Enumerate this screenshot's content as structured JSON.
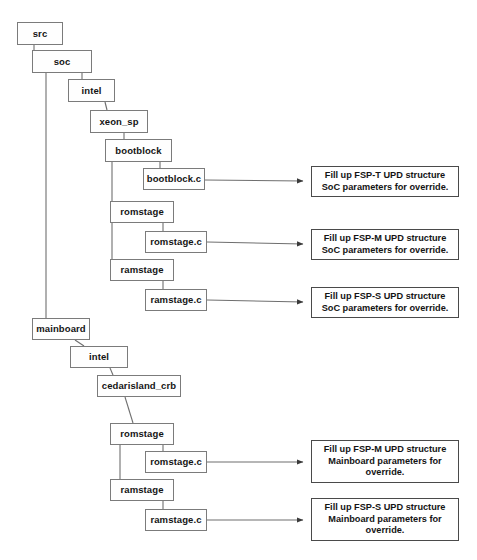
{
  "diagram": {
    "background": "#ffffff",
    "box_fill": "#fefefe",
    "box_border": "#7b7b7b",
    "note_border": "#4a4a4a",
    "line_color": "#6f6f6f",
    "text_color": "#141414",
    "nodes": [
      {
        "id": "src",
        "label": "src",
        "x": 17,
        "y": 22,
        "w": 46,
        "h": 23
      },
      {
        "id": "soc",
        "label": "soc",
        "x": 32,
        "y": 50,
        "w": 60,
        "h": 23
      },
      {
        "id": "intel_soc",
        "label": "intel",
        "x": 68,
        "y": 79,
        "w": 47,
        "h": 23
      },
      {
        "id": "xeon_sp",
        "label": "xeon_sp",
        "x": 90,
        "y": 110,
        "w": 58,
        "h": 23
      },
      {
        "id": "bootblock",
        "label": "bootblock",
        "x": 105,
        "y": 139,
        "w": 67,
        "h": 23
      },
      {
        "id": "bootblock_c",
        "label": "bootblock.c",
        "x": 143,
        "y": 168,
        "w": 62,
        "h": 22
      },
      {
        "id": "romstage_soc",
        "label": "romstage",
        "x": 110,
        "y": 201,
        "w": 64,
        "h": 22
      },
      {
        "id": "romstage_c_soc",
        "label": "romstage.c",
        "x": 145,
        "y": 231,
        "w": 62,
        "h": 22
      },
      {
        "id": "ramstage_soc",
        "label": "ramstage",
        "x": 110,
        "y": 259,
        "w": 64,
        "h": 22
      },
      {
        "id": "ramstage_c_soc",
        "label": "ramstage.c",
        "x": 145,
        "y": 289,
        "w": 62,
        "h": 22
      },
      {
        "id": "mainboard",
        "label": "mainboard",
        "x": 32,
        "y": 318,
        "w": 58,
        "h": 22
      },
      {
        "id": "intel_mb",
        "label": "intel",
        "x": 70,
        "y": 346,
        "w": 58,
        "h": 22
      },
      {
        "id": "cedarisland_crb",
        "label": "cedarisland_crb",
        "x": 97,
        "y": 375,
        "w": 84,
        "h": 22
      },
      {
        "id": "romstage_mb",
        "label": "romstage",
        "x": 110,
        "y": 423,
        "w": 64,
        "h": 22
      },
      {
        "id": "romstage_c_mb",
        "label": "romstage.c",
        "x": 145,
        "y": 451,
        "w": 62,
        "h": 22
      },
      {
        "id": "ramstage_mb",
        "label": "ramstage",
        "x": 110,
        "y": 479,
        "w": 64,
        "h": 22
      },
      {
        "id": "ramstage_c_mb",
        "label": "ramstage.c",
        "x": 145,
        "y": 509,
        "w": 62,
        "h": 22
      }
    ],
    "notes": [
      {
        "id": "note_fsp_t_soc",
        "text": "Fill up FSP-T UPD structure SoC parameters for override.",
        "x": 311,
        "y": 166,
        "w": 148,
        "h": 31
      },
      {
        "id": "note_fsp_m_soc",
        "text": "Fill up FSP-M UPD structure SoC parameters for override.",
        "x": 311,
        "y": 229,
        "w": 148,
        "h": 31
      },
      {
        "id": "note_fsp_s_soc",
        "text": "Fill up FSP-S UPD structure SoC parameters for override.",
        "x": 311,
        "y": 287,
        "w": 148,
        "h": 31
      },
      {
        "id": "note_fsp_m_mb",
        "text": "Fill up FSP-M UPD structure Mainboard parameters for override.",
        "x": 311,
        "y": 440,
        "w": 148,
        "h": 43
      },
      {
        "id": "note_fsp_s_mb",
        "text": "Fill up FSP-S UPD structure Mainboard parameters for override.",
        "x": 311,
        "y": 498,
        "w": 148,
        "h": 43
      }
    ]
  }
}
